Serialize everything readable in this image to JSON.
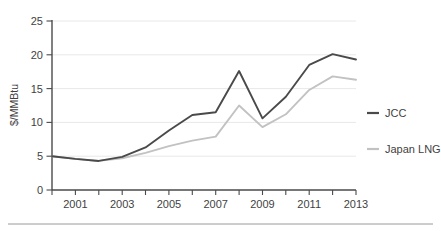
{
  "chart_data": {
    "type": "line",
    "title": "",
    "subtitle": "",
    "xlabel": "",
    "ylabel": "$/MMBtu",
    "x": [
      2000,
      2001,
      2002,
      2003,
      2004,
      2005,
      2006,
      2007,
      2008,
      2009,
      2010,
      2011,
      2012,
      2013
    ],
    "xtick_labels": [
      "2001",
      "2003",
      "2005",
      "2007",
      "2009",
      "2011",
      "2013"
    ],
    "xtick_values": [
      2001,
      2003,
      2005,
      2007,
      2009,
      2011,
      2013
    ],
    "xlim": [
      2000,
      2013
    ],
    "ytick_labels": [
      "0",
      "5",
      "10",
      "15",
      "20",
      "25"
    ],
    "ytick_values": [
      0,
      5,
      10,
      15,
      20,
      25
    ],
    "ylim": [
      0,
      25
    ],
    "grid": true,
    "grid_axis": "y",
    "legend_position": "right",
    "series": [
      {
        "name": "JCC",
        "color": "#4a4a4a",
        "values": [
          5.0,
          4.6,
          4.3,
          4.9,
          6.3,
          8.8,
          11.1,
          11.5,
          17.6,
          10.6,
          13.8,
          18.5,
          20.1,
          19.3
        ]
      },
      {
        "name": "Japan LNG",
        "color": "#c2c2c2",
        "values": [
          5.0,
          4.6,
          4.3,
          4.7,
          5.5,
          6.5,
          7.3,
          7.9,
          12.5,
          9.3,
          11.2,
          14.8,
          16.8,
          16.3
        ]
      }
    ]
  },
  "legend": {
    "items": [
      {
        "label": "JCC",
        "color": "#4a4a4a"
      },
      {
        "label": "Japan LNG",
        "color": "#c2c2c2"
      }
    ]
  },
  "axes": {
    "y_title": "$/MMBtu",
    "y_ticks": [
      "25",
      "20",
      "15",
      "10",
      "5",
      "0"
    ],
    "x_ticks": [
      "2001",
      "2003",
      "2005",
      "2007",
      "2009",
      "2011",
      "2013"
    ]
  }
}
